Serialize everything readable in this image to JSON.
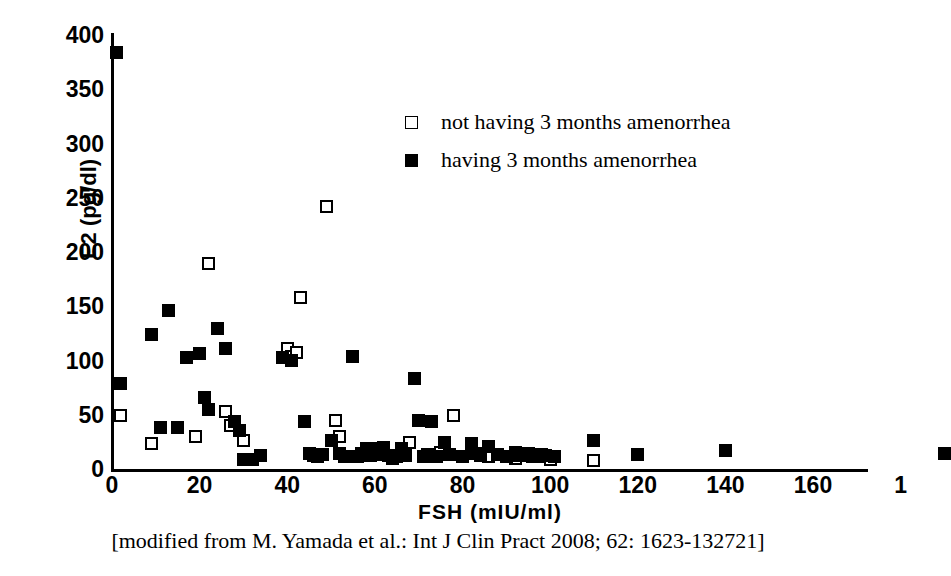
{
  "chart_data": {
    "type": "scatter",
    "title": "",
    "xlabel": "FSH (mIU/ml)",
    "ylabel": "E2 (pg/dl)",
    "xlim": [
      0,
      192
    ],
    "ylim": [
      0,
      400
    ],
    "xticks": [
      "0",
      "20",
      "40",
      "60",
      "80",
      "100",
      "120",
      "140",
      "160",
      "1"
    ],
    "xtick_values": [
      0,
      20,
      40,
      60,
      80,
      100,
      120,
      140,
      160,
      180
    ],
    "yticks": [
      "0",
      "50",
      "100",
      "150",
      "200",
      "250",
      "300",
      "350",
      "400"
    ],
    "ytick_values": [
      0,
      50,
      100,
      150,
      200,
      250,
      300,
      350,
      400
    ],
    "grid": false,
    "legend_position": "upper-center",
    "series": [
      {
        "name": "not having 3 months amenorrhea",
        "marker": "open-square",
        "color": "#ffffff",
        "edge_color": "#000000",
        "points": [
          [
            2,
            50
          ],
          [
            9,
            24
          ],
          [
            19,
            31
          ],
          [
            22,
            190
          ],
          [
            26,
            54
          ],
          [
            27,
            41
          ],
          [
            30,
            27
          ],
          [
            40,
            112
          ],
          [
            41,
            105
          ],
          [
            42,
            108
          ],
          [
            43,
            159
          ],
          [
            49,
            243
          ],
          [
            51,
            46
          ],
          [
            52,
            31
          ],
          [
            60,
            20
          ],
          [
            68,
            25
          ],
          [
            72,
            14
          ],
          [
            75,
            16
          ],
          [
            78,
            50
          ],
          [
            86,
            12
          ],
          [
            92,
            11
          ],
          [
            95,
            13
          ],
          [
            99,
            12
          ],
          [
            100,
            10
          ],
          [
            110,
            9
          ]
        ]
      },
      {
        "name": "having 3 months amenorrhea",
        "marker": "filled-square",
        "color": "#000000",
        "edge_color": "#000000",
        "points": [
          [
            1,
            385
          ],
          [
            2,
            80
          ],
          [
            9,
            125
          ],
          [
            11,
            39
          ],
          [
            13,
            147
          ],
          [
            15,
            39
          ],
          [
            17,
            104
          ],
          [
            20,
            107
          ],
          [
            21,
            67
          ],
          [
            22,
            56
          ],
          [
            24,
            130
          ],
          [
            26,
            112
          ],
          [
            28,
            45
          ],
          [
            29,
            36
          ],
          [
            30,
            10
          ],
          [
            32,
            10
          ],
          [
            34,
            13
          ],
          [
            39,
            104
          ],
          [
            41,
            101
          ],
          [
            44,
            45
          ],
          [
            45,
            15
          ],
          [
            46,
            13
          ],
          [
            47,
            12
          ],
          [
            48,
            14
          ],
          [
            50,
            27
          ],
          [
            52,
            15
          ],
          [
            53,
            12
          ],
          [
            55,
            105
          ],
          [
            56,
            12
          ],
          [
            57,
            15
          ],
          [
            58,
            20
          ],
          [
            59,
            13
          ],
          [
            60,
            18
          ],
          [
            61,
            14
          ],
          [
            62,
            21
          ],
          [
            63,
            13
          ],
          [
            64,
            11
          ],
          [
            65,
            12
          ],
          [
            66,
            20
          ],
          [
            67,
            13
          ],
          [
            69,
            84
          ],
          [
            70,
            46
          ],
          [
            71,
            12
          ],
          [
            73,
            45
          ],
          [
            74,
            12
          ],
          [
            76,
            25
          ],
          [
            77,
            14
          ],
          [
            80,
            12
          ],
          [
            82,
            24
          ],
          [
            83,
            15
          ],
          [
            84,
            13
          ],
          [
            86,
            22
          ],
          [
            88,
            14
          ],
          [
            90,
            12
          ],
          [
            92,
            16
          ],
          [
            93,
            13
          ],
          [
            95,
            15
          ],
          [
            96,
            12
          ],
          [
            98,
            14
          ],
          [
            99,
            13
          ],
          [
            101,
            12
          ],
          [
            110,
            27
          ],
          [
            120,
            14
          ],
          [
            140,
            18
          ],
          [
            190,
            15
          ]
        ]
      }
    ]
  },
  "legend": {
    "items": [
      {
        "label": "not having 3 months amenorrhea",
        "style": "open"
      },
      {
        "label": "having 3 months amenorrhea",
        "style": "filled"
      }
    ]
  },
  "caption": {
    "text": "[modified from M. Yamada et al.: Int J Clin Pract 2008; 62: 1623-132721]"
  }
}
